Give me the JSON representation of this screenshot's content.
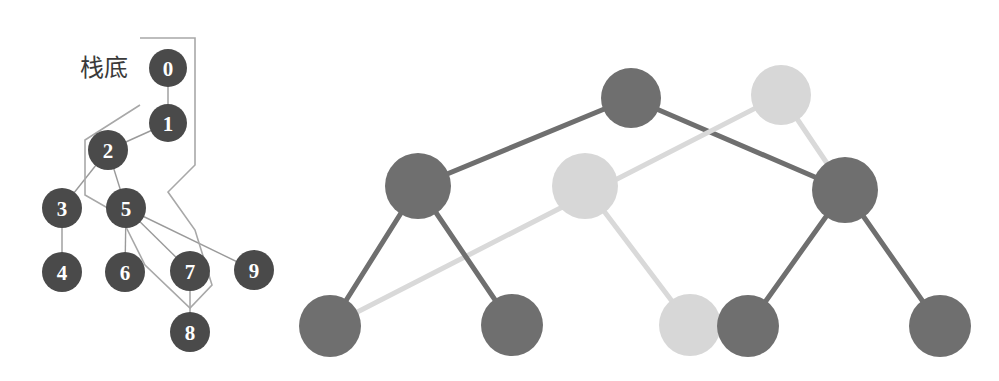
{
  "figure": {
    "width": 999,
    "height": 381,
    "background_color": "#ffffff"
  },
  "colors": {
    "node_dark": "#4a4a4a",
    "node_label": "#ffffff",
    "edge_thin": "#9a9a9a",
    "stack_outline": "#a8a8a8",
    "tree_node_dark": "#6f6f6f",
    "tree_node_light": "#d7d7d7",
    "tree_edge_dark": "#6f6f6f",
    "tree_edge_light": "#d9d9d9",
    "annotation_text": "#3a3a3a"
  },
  "left_diagram": {
    "name": "graph-with-stack-path",
    "annotation": {
      "label": "栈底",
      "x": 104,
      "y": 68
    },
    "nodes": [
      {
        "id": "0",
        "label": "0",
        "cx": 168,
        "cy": 68,
        "r": 19,
        "color": "#4a4a4a"
      },
      {
        "id": "1",
        "label": "1",
        "cx": 168,
        "cy": 123,
        "r": 19,
        "color": "#4a4a4a"
      },
      {
        "id": "2",
        "label": "2",
        "cx": 108,
        "cy": 150,
        "r": 20,
        "color": "#4a4a4a"
      },
      {
        "id": "3",
        "label": "3",
        "cx": 62,
        "cy": 208,
        "r": 20,
        "color": "#4a4a4a"
      },
      {
        "id": "4",
        "label": "4",
        "cx": 62,
        "cy": 272,
        "r": 20,
        "color": "#4a4a4a"
      },
      {
        "id": "5",
        "label": "5",
        "cx": 126,
        "cy": 208,
        "r": 20,
        "color": "#4a4a4a"
      },
      {
        "id": "6",
        "label": "6",
        "cx": 125,
        "cy": 272,
        "r": 20,
        "color": "#4a4a4a"
      },
      {
        "id": "7",
        "label": "7",
        "cx": 190,
        "cy": 271,
        "r": 20,
        "color": "#4a4a4a"
      },
      {
        "id": "8",
        "label": "8",
        "cx": 190,
        "cy": 332,
        "r": 20,
        "color": "#4a4a4a"
      },
      {
        "id": "9",
        "label": "9",
        "cx": 254,
        "cy": 270,
        "r": 20,
        "color": "#4a4a4a"
      }
    ],
    "edges": [
      {
        "from": "0",
        "to": "1"
      },
      {
        "from": "1",
        "to": "2"
      },
      {
        "from": "2",
        "to": "3"
      },
      {
        "from": "2",
        "to": "5"
      },
      {
        "from": "3",
        "to": "4"
      },
      {
        "from": "5",
        "to": "6"
      },
      {
        "from": "5",
        "to": "7"
      },
      {
        "from": "5",
        "to": "9"
      },
      {
        "from": "7",
        "to": "8"
      }
    ],
    "stack_outline_points": "140,38 195,38 195,165 168,192 195,230 212,285 190,308 145,265 120,215 85,195 85,140 140,105"
  },
  "right_diagram": {
    "name": "binary-tree-highlight",
    "nodes": [
      {
        "id": "r0",
        "cx": 631,
        "cy": 98,
        "r": 30,
        "color": "#6f6f6f",
        "shade": "dark",
        "level": 0
      },
      {
        "id": "r1",
        "cx": 781,
        "cy": 95,
        "r": 30,
        "color": "#d7d7d7",
        "shade": "light",
        "level": 0
      },
      {
        "id": "m0",
        "cx": 418,
        "cy": 186,
        "r": 33,
        "color": "#6f6f6f",
        "shade": "dark",
        "level": 1
      },
      {
        "id": "m1",
        "cx": 585,
        "cy": 186,
        "r": 33,
        "color": "#d7d7d7",
        "shade": "light",
        "level": 1
      },
      {
        "id": "m2",
        "cx": 845,
        "cy": 190,
        "r": 33,
        "color": "#6f6f6f",
        "shade": "dark",
        "level": 1
      },
      {
        "id": "l0",
        "cx": 330,
        "cy": 326,
        "r": 31,
        "color": "#6f6f6f",
        "shade": "dark",
        "level": 2
      },
      {
        "id": "l1",
        "cx": 512,
        "cy": 325,
        "r": 31,
        "color": "#6f6f6f",
        "shade": "dark",
        "level": 2
      },
      {
        "id": "l2",
        "cx": 690,
        "cy": 325,
        "r": 31,
        "color": "#d7d7d7",
        "shade": "light",
        "level": 2
      },
      {
        "id": "l3",
        "cx": 748,
        "cy": 326,
        "r": 31,
        "color": "#6f6f6f",
        "shade": "dark",
        "level": 2
      },
      {
        "id": "l4",
        "cx": 940,
        "cy": 326,
        "r": 31,
        "color": "#6f6f6f",
        "shade": "dark",
        "level": 2
      }
    ],
    "edges": [
      {
        "from": "r0",
        "to": "m0",
        "shade": "dark"
      },
      {
        "from": "r0",
        "to": "m2",
        "shade": "dark"
      },
      {
        "from": "r1",
        "to": "m2",
        "shade": "light"
      },
      {
        "from": "r1",
        "to": "l0",
        "shade": "light"
      },
      {
        "from": "m0",
        "to": "l0",
        "shade": "dark"
      },
      {
        "from": "m0",
        "to": "l1",
        "shade": "dark"
      },
      {
        "from": "m1",
        "to": "l2",
        "shade": "light"
      },
      {
        "from": "m2",
        "to": "l3",
        "shade": "dark"
      },
      {
        "from": "m2",
        "to": "l4",
        "shade": "dark"
      }
    ]
  }
}
